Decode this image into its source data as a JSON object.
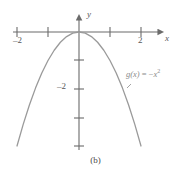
{
  "figure": {
    "caption": "(b)",
    "background_color": "#ffffff",
    "curve_color": "#9a9a9a",
    "axis_color": "#6b6b6b",
    "text_color": "#575757",
    "label_color": "#8a8a8a"
  },
  "labels": {
    "x_axis_name": "x",
    "y_axis_name": "y",
    "x_tick_neg2": "–2",
    "x_tick_2": "2",
    "y_tick_neg2": "–2",
    "function_name": "g(x)",
    "function_equals": " = ",
    "function_minus": "−",
    "function_base": "x",
    "function_exponent": "2",
    "function_full": "g(x) = −x²"
  },
  "chart_data": {
    "type": "line",
    "title": "",
    "subtitle": "",
    "xlabel": "x",
    "ylabel": "y",
    "caption": "(b)",
    "equation": "g(x) = -x^2",
    "legend": [
      "g(x) = −x²"
    ],
    "legend_position": "inline-right",
    "grid": false,
    "xlim": [
      -2.15,
      2.15
    ],
    "ylim": [
      -4.0,
      0.45
    ],
    "xticks": [
      -2,
      -1,
      0,
      1,
      2
    ],
    "xtick_labels": [
      "–2",
      "",
      "",
      "",
      "2"
    ],
    "yticks": [
      -1,
      -2,
      -3,
      -4
    ],
    "ytick_labels": [
      "",
      "–2",
      "",
      ""
    ],
    "series": [
      {
        "name": "g(x) = −x²",
        "x": [
          -2.0,
          -1.8,
          -1.6,
          -1.4,
          -1.2,
          -1.0,
          -0.8,
          -0.6,
          -0.4,
          -0.2,
          0.0,
          0.2,
          0.4,
          0.6,
          0.8,
          1.0,
          1.2,
          1.4,
          1.6,
          1.8,
          2.0
        ],
        "y": [
          -4.0,
          -3.24,
          -2.56,
          -1.96,
          -1.44,
          -1.0,
          -0.64,
          -0.36,
          -0.16,
          -0.04,
          0.0,
          -0.04,
          -0.16,
          -0.36,
          -0.64,
          -1.0,
          -1.44,
          -1.96,
          -2.56,
          -3.24,
          -4.0
        ]
      }
    ]
  }
}
